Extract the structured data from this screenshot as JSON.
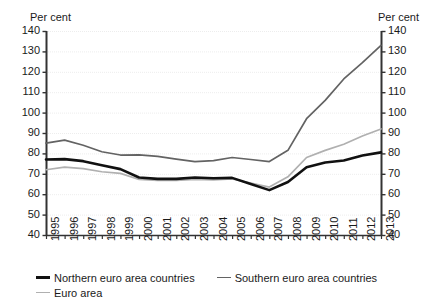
{
  "axis_titles": {
    "left": "Per cent",
    "right": "Per cent"
  },
  "legend": {
    "items": [
      {
        "id": "northern",
        "label": "Northern euro area countries",
        "color": "#111111",
        "width": 2.6
      },
      {
        "id": "southern",
        "label": "Southern euro area countries",
        "color": "#636363",
        "width": 1.7
      },
      {
        "id": "euro_area",
        "label": "Euro area",
        "color": "#b0b0b0",
        "width": 1.7
      }
    ]
  },
  "chart_data": {
    "type": "line",
    "title": "",
    "xlabel": "",
    "ylabel": "Per cent",
    "ylim": [
      40,
      140
    ],
    "ytick_step": 10,
    "yticks": [
      40,
      50,
      60,
      70,
      80,
      90,
      100,
      110,
      120,
      130,
      140
    ],
    "grid": true,
    "grid_color": "#ededed",
    "legend_position": "bottom-left",
    "dual_axis": true,
    "x": [
      1995,
      1996,
      1997,
      1998,
      1999,
      2000,
      2001,
      2002,
      2003,
      2004,
      2005,
      2006,
      2007,
      2008,
      2009,
      2010,
      2011,
      2012,
      2013
    ],
    "categories": [
      "1995",
      "1996",
      "1997",
      "1998",
      "1999",
      "2000",
      "2001",
      "2002",
      "2003",
      "2004",
      "2005",
      "2006",
      "2007",
      "2008",
      "2009",
      "2010",
      "2011",
      "2012",
      "2013"
    ],
    "series": [
      {
        "name": "Northern euro area countries",
        "color": "#111111",
        "width": 2.6,
        "values": [
          77.0,
          77.2,
          76.2,
          74.2,
          72.3,
          68.2,
          67.5,
          67.5,
          68.2,
          67.8,
          68.0,
          65.0,
          62.0,
          66.0,
          73.2,
          75.5,
          76.5,
          79.0,
          80.5
        ]
      },
      {
        "name": "Southern euro area countries",
        "color": "#636363",
        "width": 1.7,
        "values": [
          85.0,
          86.5,
          84.0,
          80.8,
          79.2,
          79.3,
          78.5,
          77.2,
          76.0,
          76.5,
          78.0,
          77.0,
          76.0,
          81.5,
          97.0,
          106.0,
          116.5,
          124.5,
          133.0
        ]
      },
      {
        "name": "Euro area",
        "color": "#b0b0b0",
        "width": 1.7,
        "values": [
          72.0,
          73.3,
          72.5,
          71.0,
          70.2,
          67.2,
          66.8,
          66.8,
          67.2,
          67.0,
          67.5,
          65.5,
          63.5,
          68.5,
          78.0,
          81.5,
          84.5,
          88.5,
          92.0
        ]
      }
    ]
  }
}
